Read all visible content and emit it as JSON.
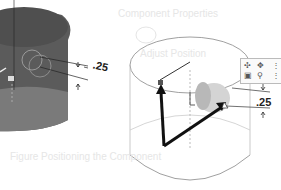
{
  "figure": {
    "left_view": {
      "description": "shaded cylinder with dimension",
      "dimension_label": ".25",
      "fill_color": "#5a5a5a"
    },
    "right_view": {
      "description": "transparent cylinder with triad arrows and dimension",
      "dimension_label": ".25",
      "toolbar_icons": [
        "rotate-icon",
        "move-icon",
        "info-icon",
        "cube-icon",
        "pin-icon",
        "info-icon"
      ]
    },
    "ghost_text": {
      "top_right": "Component Properties",
      "middle_right": "Adjust Position",
      "bottom": "Figure Positioning the Component"
    }
  }
}
